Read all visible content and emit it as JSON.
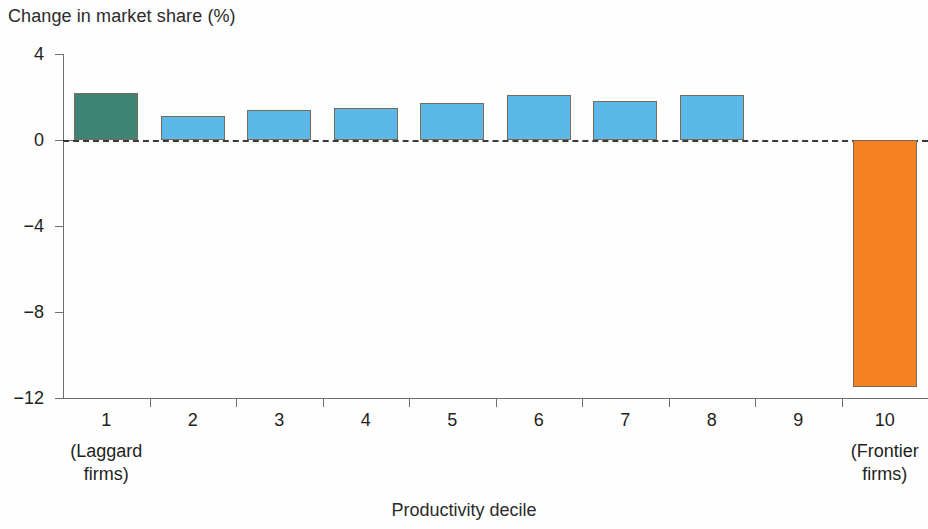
{
  "chart_data": {
    "type": "bar",
    "title": "",
    "ylabel": "Change in market share (%)",
    "xlabel": "Productivity decile",
    "categories": [
      "1",
      "2",
      "3",
      "4",
      "5",
      "6",
      "7",
      "8",
      "9",
      "10"
    ],
    "category_sublabels": [
      "(Laggard\nfirms)",
      "",
      "",
      "",
      "",
      "",
      "",
      "",
      "",
      "(Frontier\nfirms)"
    ],
    "category_sublabel_lines": {
      "first": [
        "(Laggard",
        "firms)"
      ],
      "last": [
        "(Frontier",
        "firms)"
      ]
    },
    "values": [
      2.2,
      1.1,
      1.4,
      1.5,
      1.7,
      2.1,
      1.8,
      2.1,
      0.0,
      -11.5
    ],
    "ylim": [
      -12,
      4
    ],
    "yticks": [
      4,
      0,
      -4,
      -8,
      -12
    ],
    "ytick_labels": [
      "4",
      "0",
      "−4",
      "−8",
      "−12"
    ],
    "grid": false,
    "legend": false,
    "zero_line_style": "dashed",
    "bar_colors": [
      "#3d8475",
      "#5bb8e8",
      "#5bb8e8",
      "#5bb8e8",
      "#5bb8e8",
      "#5bb8e8",
      "#5bb8e8",
      "#5bb8e8",
      "#5bb8e8",
      "#f58220"
    ],
    "colors": {
      "laggard_bar": "#3d8475",
      "middle_bars": "#5bb8e8",
      "frontier_bar": "#f58220",
      "axis": "#6d6e70",
      "text": "#231f20",
      "zero_line": "#3a3a3a"
    }
  }
}
